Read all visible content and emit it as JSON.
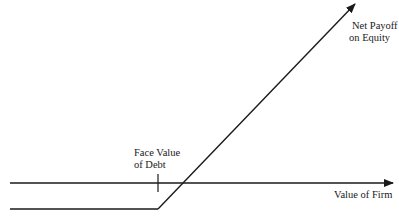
{
  "diagram": {
    "title": "",
    "type": "payoff-diagram",
    "colors": {
      "background": "#ffffff",
      "line": "#1a1a1a",
      "text": "#1a1a1a"
    },
    "labels": {
      "net_payoff": {
        "line1": "Net Payoff",
        "line2": "on Equity"
      },
      "face_value": {
        "line1": "Face Value",
        "line2": "of Debt"
      },
      "x_axis": "Value of Firm"
    },
    "geometry": {
      "x_axis": {
        "x1": 10,
        "y": 183,
        "x2": 393
      },
      "payoff_flat": {
        "x1": 10,
        "y": 209,
        "x2": 158
      },
      "payoff_rising": {
        "x1": 158,
        "y1": 209,
        "x2": 355,
        "y2": 4
      },
      "face_value_tick": {
        "x": 158,
        "y1": 174,
        "y2": 192
      }
    }
  }
}
